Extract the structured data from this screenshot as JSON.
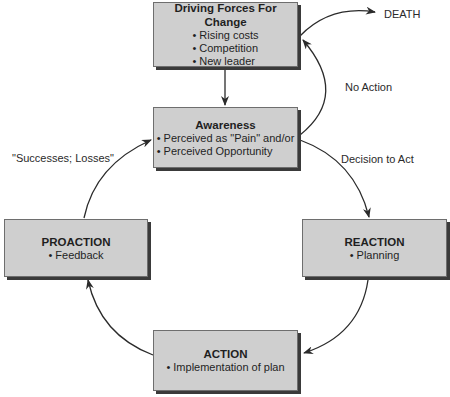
{
  "diagram": {
    "type": "cycle-flowchart",
    "colors": {
      "box_fill": "#cfcfcf",
      "box_border": "#6e6e6e",
      "shadow": "#3a3a3a",
      "arrow": "#2b2b2b",
      "background": "#ffffff"
    },
    "nodes": {
      "driving_forces": {
        "title": "Driving Forces For Change",
        "bullets": [
          "Rising costs",
          "Competition",
          "New leader"
        ]
      },
      "awareness": {
        "title": "Awareness",
        "bullets": [
          "Perceived as \"Pain\" and/or",
          "Perceived Opportunity"
        ]
      },
      "reaction": {
        "title": "REACTION",
        "bullets": [
          "Planning"
        ]
      },
      "action": {
        "title": "ACTION",
        "bullets": [
          "Implementation of plan"
        ]
      },
      "proaction": {
        "title": "PROACTION",
        "bullets": [
          "Feedback"
        ]
      }
    },
    "labels": {
      "death": "DEATH",
      "no_action": "No Action",
      "decision_to_act": "Decision to Act",
      "successes_losses": "\"Successes; Losses\""
    },
    "edges": [
      {
        "from": "driving_forces",
        "to": "awareness",
        "label": ""
      },
      {
        "from": "awareness",
        "to": "driving_forces",
        "label": "No Action"
      },
      {
        "from": "driving_forces",
        "to": "death",
        "label": ""
      },
      {
        "from": "awareness",
        "to": "reaction",
        "label": "Decision to Act"
      },
      {
        "from": "reaction",
        "to": "action",
        "label": ""
      },
      {
        "from": "action",
        "to": "proaction",
        "label": ""
      },
      {
        "from": "proaction",
        "to": "awareness",
        "label": "\"Successes; Losses\""
      }
    ]
  }
}
